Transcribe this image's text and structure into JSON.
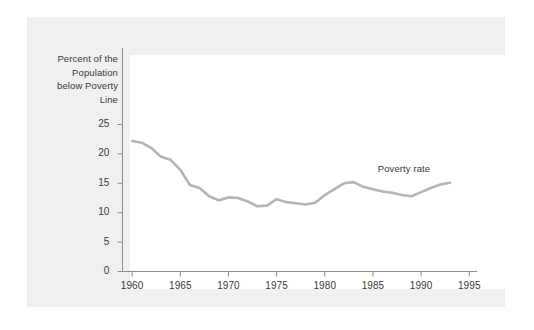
{
  "figure": {
    "background_color": "#f0f0f0",
    "panel_color": "#ffffff",
    "axis_color": "#8c8c8c",
    "text_color": "#3a3a3a"
  },
  "chart_data": {
    "type": "line",
    "title": "",
    "subtitle": "",
    "xlabel": "",
    "ylabel": "Percent of the Population below Poverty Line",
    "ylabel_lines": [
      "Percent of the",
      "Population",
      "below Poverty",
      "Line"
    ],
    "series_label": "Poverty rate",
    "line_color": "#b4b4b4",
    "line_width": 2.6,
    "grid": false,
    "legend_position": "inline-right",
    "xlim": [
      1959.0,
      1995.8
    ],
    "ylim": [
      0,
      27.5
    ],
    "xticks": [
      1960,
      1965,
      1970,
      1975,
      1980,
      1985,
      1990,
      1995
    ],
    "xtick_labels": [
      "1960",
      "1965",
      "1970",
      "1975",
      "1980",
      "1985",
      "1990",
      "1995"
    ],
    "yticks": [
      0,
      5,
      10,
      15,
      20,
      25
    ],
    "ytick_labels": [
      "0",
      "5",
      "10",
      "15",
      "20",
      "25"
    ],
    "series": [
      {
        "name": "Poverty rate",
        "x": [
          1960,
          1961,
          1962,
          1963,
          1964,
          1965,
          1966,
          1967,
          1968,
          1969,
          1970,
          1971,
          1972,
          1973,
          1974,
          1975,
          1976,
          1977,
          1978,
          1979,
          1980,
          1981,
          1982,
          1983,
          1984,
          1985,
          1986,
          1987,
          1988,
          1989,
          1990,
          1991,
          1992,
          1993
        ],
        "values": [
          22.2,
          21.9,
          21.0,
          19.5,
          19.0,
          17.3,
          14.7,
          14.2,
          12.8,
          12.1,
          12.6,
          12.5,
          11.9,
          11.1,
          11.2,
          12.3,
          11.8,
          11.6,
          11.4,
          11.7,
          13.0,
          14.0,
          15.0,
          15.2,
          14.4,
          14.0,
          13.6,
          13.4,
          13.0,
          12.8,
          13.5,
          14.2,
          14.8,
          15.1
        ]
      }
    ]
  }
}
